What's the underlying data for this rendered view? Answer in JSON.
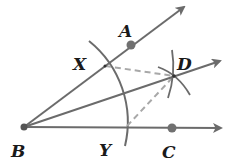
{
  "diagram": {
    "labels": {
      "A": "A",
      "B": "B",
      "C": "C",
      "D": "D",
      "X": "X",
      "Y": "Y"
    },
    "points": {
      "B": {
        "x": 24,
        "y": 127
      },
      "A": {
        "x": 131,
        "y": 45
      },
      "C": {
        "x": 172,
        "y": 128
      },
      "X": {
        "x": 105,
        "y": 66
      },
      "Y": {
        "x": 125,
        "y": 128
      },
      "D": {
        "x": 174,
        "y": 76
      }
    },
    "rays": [
      "BA",
      "BD",
      "BC"
    ],
    "dashed_segments": [
      "XD",
      "YD"
    ],
    "colors": {
      "line": "#6b6b6b",
      "point": "#707070",
      "dashed": "#a8a8a8",
      "label": "#1a1a1a"
    }
  }
}
